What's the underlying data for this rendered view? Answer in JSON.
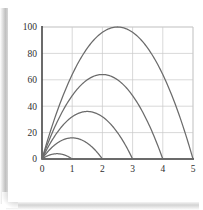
{
  "figure": {
    "title": "",
    "background_color": "#ffffff",
    "curve_color": "#6b6b6b",
    "axis_color": "#3a3a3a",
    "grid_color": "#c8c8c8",
    "tick_label_color": "#2f2f2f"
  },
  "chart_data": {
    "type": "line",
    "title": "",
    "subtitle": "",
    "xlabel": "",
    "ylabel": "",
    "xlim": [
      0,
      5
    ],
    "ylim": [
      0,
      100
    ],
    "xticks": [
      0,
      1,
      2,
      3,
      4,
      5
    ],
    "yticks": [
      0,
      20,
      40,
      60,
      80,
      100
    ],
    "xtick_labels": [
      "0",
      "1",
      "2",
      "3",
      "4",
      "5"
    ],
    "ytick_labels": [
      "0",
      "20",
      "40",
      "60",
      "80",
      "100"
    ],
    "grid": true,
    "legend": null,
    "legend_position": "none",
    "annotations": [],
    "series": [
      {
        "name": "range-1",
        "color": "#6b6b6b",
        "range": 1,
        "apex_x": 0.5,
        "apex_y": 4,
        "x": [
          0,
          0.125,
          0.25,
          0.375,
          0.5,
          0.625,
          0.75,
          0.875,
          1
        ],
        "y": [
          0,
          2.75,
          4,
          4,
          4,
          4,
          4,
          2.75,
          0
        ]
      },
      {
        "name": "range-2",
        "color": "#6b6b6b",
        "range": 2,
        "apex_x": 1,
        "apex_y": 16,
        "x": [
          0,
          0.25,
          0.5,
          0.75,
          1,
          1.25,
          1.5,
          1.75,
          2
        ],
        "y": [
          0,
          7,
          12,
          15,
          16,
          15,
          12,
          7,
          0
        ]
      },
      {
        "name": "range-3",
        "color": "#6b6b6b",
        "range": 3,
        "apex_x": 1.5,
        "apex_y": 36,
        "x": [
          0,
          0.375,
          0.75,
          1.125,
          1.5,
          1.875,
          2.25,
          2.625,
          3
        ],
        "y": [
          0,
          15.75,
          27,
          33.75,
          36,
          33.75,
          27,
          15.75,
          0
        ]
      },
      {
        "name": "range-4",
        "color": "#6b6b6b",
        "range": 4,
        "apex_x": 2,
        "apex_y": 64,
        "x": [
          0,
          0.5,
          1,
          1.5,
          2,
          2.5,
          3,
          3.5,
          4
        ],
        "y": [
          0,
          28,
          48,
          60,
          64,
          60,
          48,
          28,
          0
        ]
      },
      {
        "name": "range-5",
        "color": "#6b6b6b",
        "range": 5,
        "apex_x": 2.5,
        "apex_y": 100,
        "x": [
          0,
          0.625,
          1.25,
          1.875,
          2.5,
          3.125,
          3.75,
          4.375,
          5
        ],
        "y": [
          0,
          43.75,
          75,
          93.75,
          100,
          93.75,
          75,
          43.75,
          0
        ]
      }
    ]
  }
}
